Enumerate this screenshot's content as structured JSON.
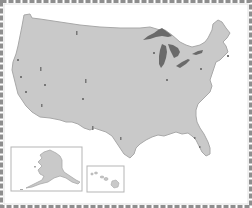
{
  "map": {
    "type": "outline-map",
    "region": "United States",
    "labels_visible": false,
    "colors": {
      "background": "#ffffff",
      "land": "#c9c9c9",
      "land_edge": "#a8a8a8",
      "water_lakes": "#6a6a6a",
      "border_dash": "#8e8e8e",
      "inset_border": "#b5b5b5",
      "marker": "#777777"
    },
    "main": {
      "name": "contiguous-us"
    },
    "insets": [
      {
        "name": "alaska"
      },
      {
        "name": "hawaii"
      }
    ],
    "features": [
      {
        "name": "great-lakes"
      }
    ],
    "markers": [
      {
        "x": 77,
        "y": 33
      },
      {
        "x": 18,
        "y": 60
      },
      {
        "x": 41,
        "y": 69
      },
      {
        "x": 21,
        "y": 77
      },
      {
        "x": 45,
        "y": 85
      },
      {
        "x": 86,
        "y": 81
      },
      {
        "x": 26,
        "y": 92
      },
      {
        "x": 83,
        "y": 99
      },
      {
        "x": 42,
        "y": 105
      },
      {
        "x": 93,
        "y": 128
      },
      {
        "x": 121,
        "y": 138
      },
      {
        "x": 167,
        "y": 80
      },
      {
        "x": 154,
        "y": 53
      },
      {
        "x": 201,
        "y": 69
      },
      {
        "x": 228,
        "y": 56
      },
      {
        "x": 195,
        "y": 138
      },
      {
        "x": 200,
        "y": 147
      }
    ]
  }
}
